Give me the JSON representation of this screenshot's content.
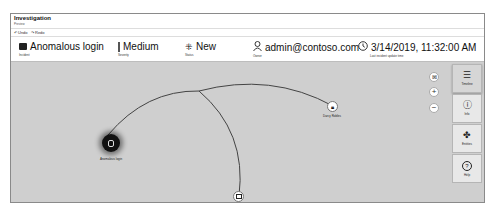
{
  "window": {
    "title": "Investigation",
    "subtitle": "Preview"
  },
  "toolbar": {
    "undo_label": "Undo",
    "redo_label": "Redo"
  },
  "info": {
    "incident": {
      "value": "Anomalous login",
      "label": "Incident",
      "icon": "briefcase-icon"
    },
    "severity": {
      "value": "Medium",
      "label": "Severity",
      "icon": "severity-bar-icon"
    },
    "status": {
      "value": "New",
      "label": "Status",
      "icon": "sparkle-icon"
    },
    "owner": {
      "value": "admin@contoso.com",
      "label": "Owner",
      "icon": "person-icon"
    },
    "updated": {
      "value": "3/14/2019, 11:32:00 AM",
      "label": "Last incident update time",
      "icon": "clock-icon"
    }
  },
  "graph": {
    "nodes": [
      {
        "id": "alert",
        "label": "Anomalous login",
        "icon": "alert-icon",
        "style": "dark"
      },
      {
        "id": "account",
        "label": "Darcy Robles",
        "icon": "lock-icon",
        "style": "light"
      },
      {
        "id": "host",
        "label": "eESDlabsdipdev",
        "icon": "computer-icon",
        "style": "light"
      }
    ]
  },
  "zoom_controls": {
    "fit_label": "⊠",
    "zoom_in_label": "+",
    "zoom_out_label": "−"
  },
  "side_panel": {
    "items": [
      {
        "label": "Timeline",
        "icon": "☰"
      },
      {
        "label": "Info",
        "icon": "ⓘ"
      },
      {
        "label": "Entities",
        "icon": "✤"
      },
      {
        "label": "Help",
        "icon": "?"
      }
    ]
  }
}
